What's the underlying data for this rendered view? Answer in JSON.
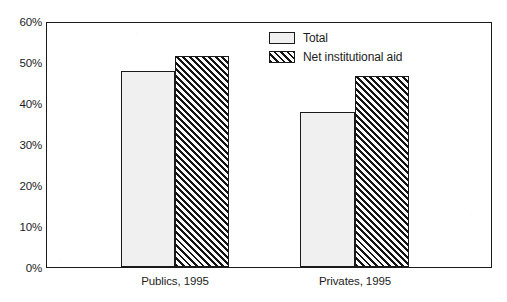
{
  "chart_data": {
    "type": "bar",
    "title": "",
    "subtitle": "",
    "xlabel": "",
    "ylabel": "",
    "categories": [
      "Publics, 1995",
      "Privates, 1995"
    ],
    "series": [
      {
        "name": "Total",
        "values": [
          48.3,
          38.0
        ],
        "style": "solid",
        "fill": "#f0f0f0"
      },
      {
        "name": "Net institutional aid",
        "values": [
          52.0,
          47.0
        ],
        "style": "hatch",
        "fill": "#141414"
      }
    ],
    "ylim": [
      0,
      60
    ],
    "ytick_values": [
      0,
      10,
      20,
      30,
      40,
      50,
      60
    ],
    "ytick_labels": [
      "0%",
      "10%",
      "20%",
      "30%",
      "40%",
      "50%",
      "60%"
    ],
    "grid": false,
    "legend_position": "top-center",
    "axis_color": "#1a1a1a",
    "value_suffix": "%"
  },
  "legend": {
    "items": [
      {
        "label": "Total",
        "swatch": "solid-swatch-icon"
      },
      {
        "label": "Net institutional aid",
        "swatch": "hatch-swatch-icon"
      }
    ]
  }
}
